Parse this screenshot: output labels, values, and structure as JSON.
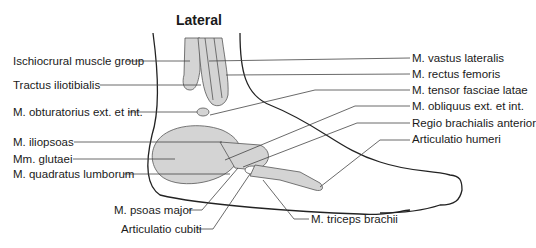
{
  "title": "Lateral",
  "labels_left": [
    {
      "text": "Ischiocrural muscle group",
      "x": 13,
      "y": 55
    },
    {
      "text": "Tractus iliotibialis",
      "x": 13,
      "y": 79
    },
    {
      "text": "M. obturatorius ext. et int.",
      "x": 13,
      "y": 106
    },
    {
      "text": "M. iliopsoas",
      "x": 13,
      "y": 136
    },
    {
      "text": "Mm. glutaei",
      "x": 13,
      "y": 153
    },
    {
      "text": "M. quadratus lumborum",
      "x": 13,
      "y": 168
    }
  ],
  "labels_bottom": [
    {
      "text": "M. psoas major",
      "x": 114,
      "y": 204
    },
    {
      "text": "Articulatio cubiti",
      "x": 121,
      "y": 223
    },
    {
      "text": "M. triceps brachii",
      "x": 311,
      "y": 213
    }
  ],
  "labels_right": [
    {
      "text": "M. vastus lateralis",
      "x": 412,
      "y": 52
    },
    {
      "text": "M. rectus femoris",
      "x": 412,
      "y": 68
    },
    {
      "text": "M. tensor fasciae latae",
      "x": 412,
      "y": 84
    },
    {
      "text": "M. obliquus ext. et int.",
      "x": 412,
      "y": 100
    },
    {
      "text": "Regio brachialis anterior",
      "x": 412,
      "y": 117
    },
    {
      "text": "Articulatio humeri",
      "x": 412,
      "y": 133
    }
  ],
  "colors": {
    "fill": "#d4d4d4",
    "line": "#222222",
    "leader": "#444444"
  }
}
